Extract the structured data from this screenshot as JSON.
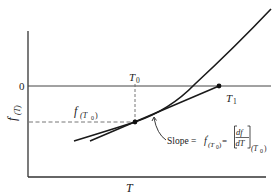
{
  "diagram": {
    "title": "",
    "axes": {
      "x_label": "T",
      "y_label": "f",
      "y_label_sub": "(T)",
      "zero_label": "0"
    },
    "points": {
      "t0_label": "T",
      "t0_sub": "0",
      "t1_label": "T",
      "t1_sub": "1",
      "f_t0_label": "f",
      "f_t0_sub": "(T",
      "f_t0_sub_sub": "0",
      "f_t0_close": ")"
    },
    "annotation": {
      "slope_text": "Slope = ",
      "slope_f": "f",
      "slope_prime": "′",
      "slope_sub": "(T",
      "slope_sub_sub": "0",
      "slope_close": ")",
      "equals": " = ",
      "frac_num": "df",
      "frac_den": "dT",
      "bracket_sub": "(T",
      "bracket_sub_sub": "0",
      "bracket_close": ")"
    },
    "colors": {
      "stroke": "#1a1a1a",
      "axis": "#333333",
      "dashed": "#666666"
    }
  }
}
